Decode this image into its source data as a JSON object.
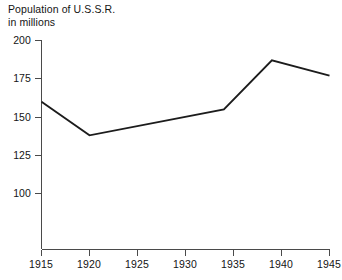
{
  "chart_data": {
    "type": "line",
    "title": "Population of U.S.S.R. in millions",
    "title_lines": [
      "Population of U.S.S.R.",
      "in millions"
    ],
    "xlabel": "",
    "ylabel": "",
    "x": [
      1915,
      1920,
      1934,
      1939,
      1945
    ],
    "values": [
      160,
      138,
      155,
      187,
      177
    ],
    "series": [
      {
        "name": "Population of U.S.S.R. (millions)",
        "points": [
          {
            "x": 1915,
            "y": 160
          },
          {
            "x": 1920,
            "y": 138
          },
          {
            "x": 1934,
            "y": 155
          },
          {
            "x": 1939,
            "y": 187
          },
          {
            "x": 1945,
            "y": 177
          }
        ]
      }
    ],
    "xlim": [
      1915,
      1945
    ],
    "ylim": [
      88,
      200
    ],
    "y_ticks": [
      100,
      125,
      150,
      175,
      200
    ],
    "y_tick_labels": [
      "100",
      "125",
      "150",
      "175",
      "200"
    ],
    "x_ticks": [
      1915,
      1920,
      1925,
      1930,
      1935,
      1940,
      1945
    ],
    "x_tick_labels": [
      "1915",
      "1920",
      "1925",
      "1930",
      "1935",
      "1940",
      "1945"
    ],
    "grid": false,
    "legend": false,
    "line_color": "#1c1c1c",
    "axis_color": "#4a4a4a",
    "background_color": "#ffffff"
  }
}
